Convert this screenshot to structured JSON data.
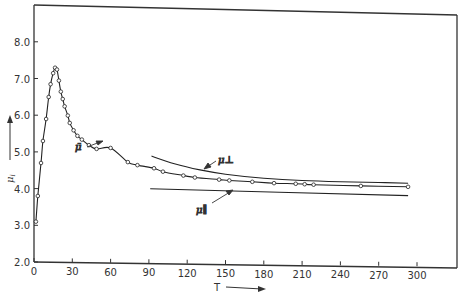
{
  "chart_data": {
    "type": "line",
    "title": "",
    "xlabel": "T",
    "ylabel": "μ_i",
    "xlim": [
      0,
      300
    ],
    "ylim": [
      2.0,
      8.0
    ],
    "x_ticks": [
      0,
      30,
      60,
      90,
      120,
      150,
      180,
      210,
      240,
      270,
      300
    ],
    "y_ticks": [
      "2.0",
      "3.0",
      "4.0",
      "5.0",
      "6.0",
      "7.0",
      "8.0"
    ],
    "grid": false,
    "legend": "inline labels with arrows",
    "series": [
      {
        "name": "μ̄ (mean, measured)",
        "label": "μ̄",
        "style": "line with open-circle markers",
        "x": [
          1.5,
          3,
          5.5,
          7,
          9.5,
          11.5,
          13,
          15,
          16.5,
          18,
          19.5,
          21,
          22.5,
          24,
          26.5,
          28,
          31,
          34,
          37.5,
          43,
          49,
          60,
          73.5,
          81,
          94,
          101,
          117,
          126,
          145,
          153,
          171,
          188,
          205,
          212,
          219,
          256,
          293
        ],
        "y": [
          3.1,
          3.8,
          4.7,
          5.3,
          5.9,
          6.5,
          6.85,
          7.15,
          7.3,
          7.25,
          6.95,
          6.65,
          6.45,
          6.25,
          6.0,
          5.8,
          5.6,
          5.45,
          5.35,
          5.2,
          5.1,
          5.13,
          4.75,
          4.67,
          4.59,
          4.5,
          4.4,
          4.35,
          4.3,
          4.28,
          4.25,
          4.22,
          4.21,
          4.2,
          4.19,
          4.17,
          4.16
        ]
      },
      {
        "name": "μ⊥",
        "label": "μ⊥",
        "style": "solid line",
        "x": [
          92,
          110,
          130,
          150,
          180,
          210,
          240,
          270,
          293
        ],
        "y": [
          4.92,
          4.72,
          4.56,
          4.45,
          4.35,
          4.3,
          4.28,
          4.27,
          4.26
        ]
      },
      {
        "name": "μ∥",
        "label": "μ∥",
        "style": "solid line",
        "x": [
          91,
          293
        ],
        "y": [
          4.03,
          3.92
        ]
      }
    ],
    "annotations": [
      {
        "text": "μ̄",
        "points_to": [
          54,
          5.45
        ]
      },
      {
        "text": "μ⊥",
        "points_to": [
          134,
          4.58
        ]
      },
      {
        "text": "μ∥",
        "points_to": [
          155,
          4.0
        ]
      }
    ]
  }
}
